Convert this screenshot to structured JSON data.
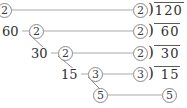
{
  "diagram": {
    "type": "factor-tree-ladder",
    "number": "120",
    "stroke_color": "#9a9a9a",
    "text_color": "#3a3a3a",
    "background": "#ffffff"
  },
  "rows": [
    {
      "left_circle": "2",
      "left_plain": "",
      "mid_circle": "",
      "divisor_circle": "2",
      "dividend": "120",
      "has_bracket": true
    },
    {
      "left_circle": "",
      "left_plain": "60",
      "mid_circle": "2",
      "divisor_circle": "2",
      "dividend": "60",
      "has_bracket": true
    },
    {
      "left_circle": "",
      "left_plain": "30",
      "mid_circle": "2",
      "divisor_circle": "2",
      "dividend": "30",
      "has_bracket": true
    },
    {
      "left_circle": "",
      "left_plain": "15",
      "mid_circle": "3",
      "divisor_circle": "3",
      "dividend": "15",
      "has_bracket": true
    },
    {
      "left_circle": "5",
      "left_plain": "",
      "mid_circle": "",
      "divisor_circle": "5",
      "dividend": "",
      "has_bracket": false
    }
  ],
  "labels": {
    "row1_left_circle": "2",
    "row1_right_circle": "2",
    "row1_dividend": "120",
    "row1_paren": ")",
    "row2_left": "60",
    "row2_mid_circle": "2",
    "row2_right_circle": "2",
    "row2_dividend": "60",
    "row2_paren": ")",
    "row3_left": "30",
    "row3_mid_circle": "2",
    "row3_right_circle": "2",
    "row3_dividend": "30",
    "row3_paren": ")",
    "row4_left": "15",
    "row4_mid_circle": "3",
    "row4_right_circle": "3",
    "row4_dividend": "15",
    "row4_paren": ")",
    "row5_left_circle": "5",
    "row5_right_circle": "5"
  }
}
